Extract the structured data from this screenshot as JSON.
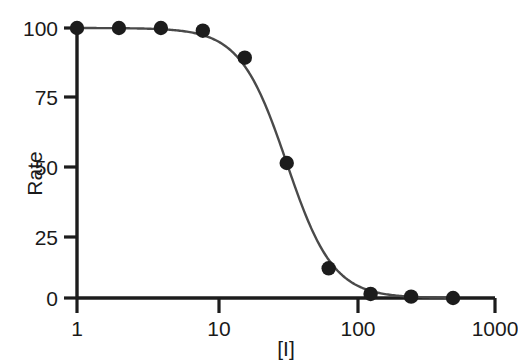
{
  "chart_data": {
    "type": "scatter",
    "title": "",
    "subtitle": "",
    "xlabel": "[I]",
    "ylabel": "Rate",
    "xscale": "log",
    "yscale": "linear",
    "xlim": [
      1,
      1000
    ],
    "ylim": [
      0,
      100
    ],
    "grid": false,
    "legend": null,
    "annotations": [],
    "x_ticks": [
      {
        "value": 1,
        "label": "1"
      },
      {
        "value": 10,
        "label": "10"
      },
      {
        "value": 100,
        "label": "100"
      },
      {
        "value": 1000,
        "label": "1000"
      }
    ],
    "y_ticks": [
      {
        "value": 0,
        "label": "0"
      },
      {
        "value": 25,
        "label": "25"
      },
      {
        "value": 50,
        "label": "50"
      },
      {
        "value": 75,
        "label": "75"
      },
      {
        "value": 100,
        "label": "100"
      }
    ],
    "series": [
      {
        "name": "Rate vs [I]",
        "marker": "filled-circle",
        "marker_color": "#1c1c1c",
        "line_color": "#4a4a4a",
        "x": [
          1,
          2,
          4,
          8,
          16,
          32,
          64,
          128,
          250,
          500
        ],
        "values": [
          100,
          100,
          100,
          99,
          89,
          50,
          11,
          1.5,
          0.5,
          0
        ]
      }
    ],
    "fit": {
      "model": "sigmoidal-inhibition",
      "ic50": 32,
      "hill_slope": 2.6,
      "top": 100,
      "bottom": 0
    }
  },
  "axes": {
    "axis_color": "#1c1c1c",
    "curve_color": "#4a4a4a",
    "background": "#ffffff"
  }
}
